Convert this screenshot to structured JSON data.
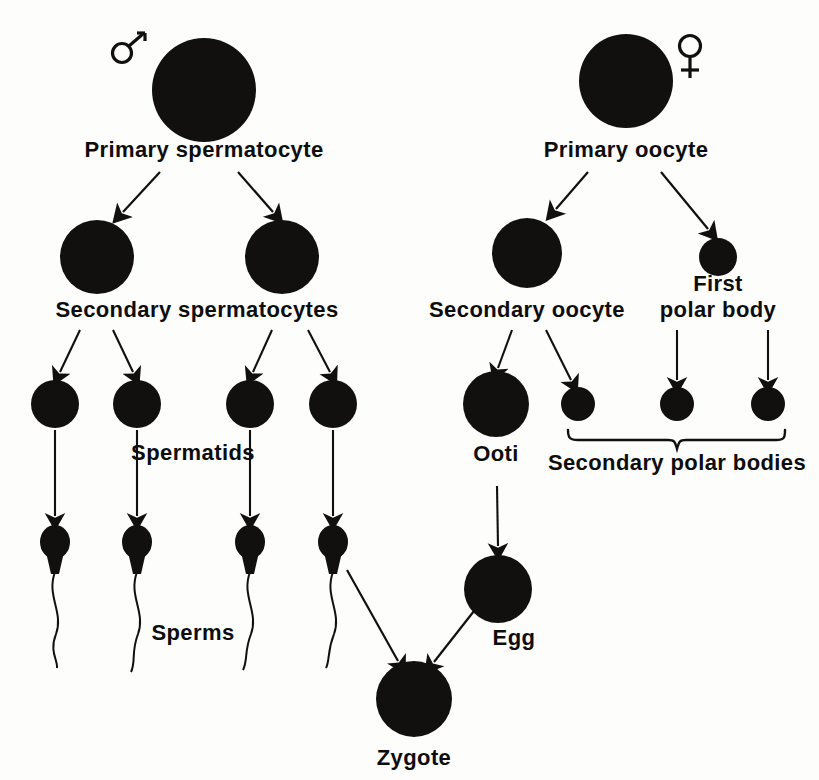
{
  "diagram": {
    "background_color": "#fdfdfc",
    "ink_color": "#120f0f",
    "male_symbol": "♂",
    "female_symbol": "♀",
    "labels": {
      "primary_spermatocyte": "Primary  spermatocyte",
      "secondary_spermatocytes": "Secondary  spermatocytes",
      "spermatids": "Spermatids",
      "sperms": "Sperms",
      "primary_oocyte": "Primary  oocyte",
      "secondary_oocyte": "Secondary  oocyte",
      "first_polar_body_line1": "First",
      "first_polar_body_line2": "polar body",
      "ootid": "Ooti",
      "secondary_polar_bodies": "Secondary  polar bodies",
      "egg": "Egg",
      "zygote": "Zygote"
    },
    "male_branch": {
      "primary_spermatocyte": {
        "cx": 204,
        "cy": 90,
        "r": 52
      },
      "secondary_spermatocytes": [
        {
          "cx": 97,
          "cy": 257,
          "r": 37
        },
        {
          "cx": 282,
          "cy": 257,
          "r": 37
        }
      ],
      "spermatids": [
        {
          "cx": 55,
          "cy": 404,
          "r": 24
        },
        {
          "cx": 137,
          "cy": 404,
          "r": 24
        },
        {
          "cx": 250,
          "cy": 404,
          "r": 24
        },
        {
          "cx": 333,
          "cy": 404,
          "r": 24
        }
      ],
      "sperms": [
        {
          "cx": 55,
          "cy": 542
        },
        {
          "cx": 137,
          "cy": 542
        },
        {
          "cx": 250,
          "cy": 542
        },
        {
          "cx": 333,
          "cy": 542
        }
      ]
    },
    "female_branch": {
      "primary_oocyte": {
        "cx": 626,
        "cy": 81,
        "r": 47
      },
      "secondary_oocyte": {
        "cx": 527,
        "cy": 253,
        "r": 35
      },
      "first_polar_body": {
        "cx": 718,
        "cy": 257,
        "r": 19
      },
      "ootid": {
        "cx": 496,
        "cy": 404,
        "r": 33
      },
      "secondary_polar_bodies": [
        {
          "cx": 578,
          "cy": 404,
          "r": 17
        },
        {
          "cx": 677,
          "cy": 404,
          "r": 17
        },
        {
          "cx": 768,
          "cy": 404,
          "r": 17
        }
      ],
      "egg": {
        "cx": 498,
        "cy": 589,
        "r": 34
      }
    },
    "fertilization": {
      "zygote": {
        "cx": 414,
        "cy": 699,
        "r": 38
      }
    }
  }
}
